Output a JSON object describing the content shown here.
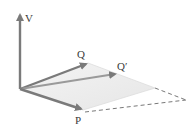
{
  "diagram": {
    "type": "vector-diagram",
    "colors": {
      "vector": "#7a7a7a",
      "plane_fill": "#eeeeee",
      "plane_edge": "#d8d8d8",
      "dashed": "#555555",
      "label": "#3a3a3a"
    },
    "origin": [
      20,
      89
    ],
    "vectors": [
      {
        "id": "V",
        "label": "V",
        "tip": [
          20,
          13
        ]
      },
      {
        "id": "Q",
        "label": "Q",
        "tip": [
          88,
          63
        ]
      },
      {
        "id": "Qprime",
        "label": "Q′",
        "tip": [
          117,
          74
        ]
      },
      {
        "id": "P",
        "label": "P",
        "tip": [
          83,
          110
        ]
      }
    ],
    "plane_corners": [
      [
        20,
        89
      ],
      [
        88,
        63
      ],
      [
        155,
        88
      ],
      [
        83,
        110
      ]
    ],
    "dashed_lines": [
      {
        "from": [
          155,
          88
        ],
        "to": [
          186,
          100
        ]
      },
      {
        "from": [
          83,
          112
        ],
        "to": [
          186,
          100
        ]
      }
    ],
    "labels": {
      "V": "V",
      "Q": "Q",
      "Qprime": "Q′",
      "P": "P"
    }
  }
}
